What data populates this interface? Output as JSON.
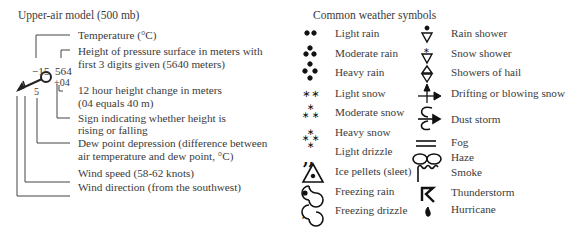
{
  "upper_air": {
    "title": "Upper-air model (500 mb)",
    "values": {
      "temperature": "−15",
      "height": "564",
      "change": "+04",
      "dewpoint": "5"
    },
    "labels": [
      "Temperature (°C)",
      "Height of pressure surface in meters with",
      "first 3 digits given (5640 meters)",
      "12 hour height change in meters",
      "(04 equals 40 m)",
      "Sign indicating whether height is",
      "rising or falling",
      "Dew point depression (difference between",
      "air temperature and dew point, °C)",
      "Wind speed (58-62 knots)",
      "Wind direction (from the southwest)"
    ]
  },
  "weather_symbols": {
    "title": "Common weather symbols",
    "left": [
      {
        "icon": "light-rain-icon",
        "label": "Light rain"
      },
      {
        "icon": "moderate-rain-icon",
        "label": "Moderate rain"
      },
      {
        "icon": "heavy-rain-icon",
        "label": "Heavy rain"
      },
      {
        "icon": "light-snow-icon",
        "label": "Light snow"
      },
      {
        "icon": "moderate-snow-icon",
        "label": "Moderate snow"
      },
      {
        "icon": "heavy-snow-icon",
        "label": "Heavy snow"
      },
      {
        "icon": "light-drizzle-icon",
        "label": "Light drizzle"
      },
      {
        "icon": "ice-pellets-icon",
        "label": "Ice pellets (sleet)"
      },
      {
        "icon": "freezing-rain-icon",
        "label": "Freezing rain"
      },
      {
        "icon": "freezing-drizzle-icon",
        "label": "Freezing drizzle"
      }
    ],
    "right": [
      {
        "icon": "rain-shower-icon",
        "label": "Rain shower"
      },
      {
        "icon": "snow-shower-icon",
        "label": "Snow shower"
      },
      {
        "icon": "hail-shower-icon",
        "label": "Showers of hail"
      },
      {
        "icon": "blowing-snow-icon",
        "label": "Drifting or blowing snow"
      },
      {
        "icon": "dust-storm-icon",
        "label": "Dust storm"
      },
      {
        "icon": "fog-icon",
        "label": "Fog"
      },
      {
        "icon": "haze-icon",
        "label": "Haze"
      },
      {
        "icon": "smoke-icon",
        "label": "Smoke"
      },
      {
        "icon": "thunderstorm-icon",
        "label": "Thunderstorm"
      },
      {
        "icon": "hurricane-icon",
        "label": "Hurricane"
      }
    ]
  }
}
